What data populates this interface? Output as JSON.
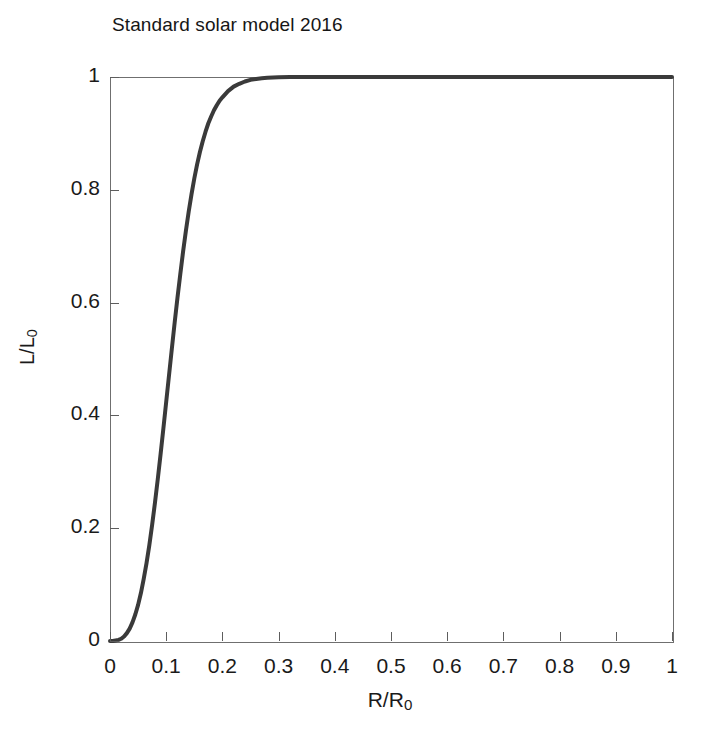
{
  "chart_data": {
    "type": "line",
    "title": "Standard solar model 2016",
    "xlabel": "R/R",
    "xlabel_sub": "0",
    "ylabel": "L/L",
    "ylabel_sub": "0",
    "xlim": [
      0,
      1
    ],
    "ylim": [
      0,
      1
    ],
    "grid": false,
    "legend": null,
    "xticks": [
      0,
      0.1,
      0.2,
      0.3,
      0.4,
      0.5,
      0.6,
      0.7,
      0.8,
      0.9,
      1
    ],
    "xticklabels": [
      "0",
      "0.1",
      "0.2",
      "0.3",
      "0.4",
      "0.5",
      "0.6",
      "0.7",
      "0.8",
      "0.9",
      "1"
    ],
    "yticks": [
      0,
      0.2,
      0.4,
      0.6,
      0.8,
      1
    ],
    "yticklabels": [
      "0",
      "0.2",
      "0.4",
      "0.6",
      "0.8",
      "1"
    ],
    "line_color": "#3a3a3a",
    "line_width": 4,
    "frame_color": "#6f6f6f",
    "series": [
      {
        "name": "Cumulative luminosity fraction",
        "x": [
          0.0,
          0.005,
          0.01,
          0.015,
          0.02,
          0.025,
          0.03,
          0.035,
          0.04,
          0.045,
          0.05,
          0.055,
          0.06,
          0.065,
          0.07,
          0.075,
          0.08,
          0.085,
          0.09,
          0.095,
          0.1,
          0.105,
          0.11,
          0.115,
          0.12,
          0.125,
          0.13,
          0.135,
          0.14,
          0.145,
          0.15,
          0.155,
          0.16,
          0.165,
          0.17,
          0.175,
          0.18,
          0.185,
          0.19,
          0.195,
          0.2,
          0.21,
          0.22,
          0.23,
          0.24,
          0.25,
          0.26,
          0.27,
          0.28,
          0.29,
          0.3,
          0.32,
          0.34,
          0.36,
          0.4,
          0.45,
          0.5,
          0.55,
          0.6,
          0.65,
          0.7,
          0.75,
          0.8,
          0.85,
          0.9,
          0.95,
          1.0
        ],
        "y": [
          0.0,
          0.0,
          0.001,
          0.002,
          0.004,
          0.008,
          0.014,
          0.022,
          0.033,
          0.047,
          0.064,
          0.085,
          0.11,
          0.138,
          0.17,
          0.206,
          0.245,
          0.287,
          0.331,
          0.377,
          0.424,
          0.471,
          0.518,
          0.564,
          0.608,
          0.65,
          0.69,
          0.727,
          0.761,
          0.792,
          0.82,
          0.845,
          0.867,
          0.886,
          0.903,
          0.918,
          0.93,
          0.941,
          0.95,
          0.958,
          0.964,
          0.975,
          0.983,
          0.988,
          0.992,
          0.995,
          0.9965,
          0.9977,
          0.9985,
          0.9991,
          0.9995,
          0.9998,
          0.9999,
          1.0,
          1.0,
          1.0,
          1.0,
          1.0,
          1.0,
          1.0,
          1.0,
          1.0,
          1.0,
          1.0,
          1.0,
          1.0,
          1.0
        ]
      }
    ]
  }
}
